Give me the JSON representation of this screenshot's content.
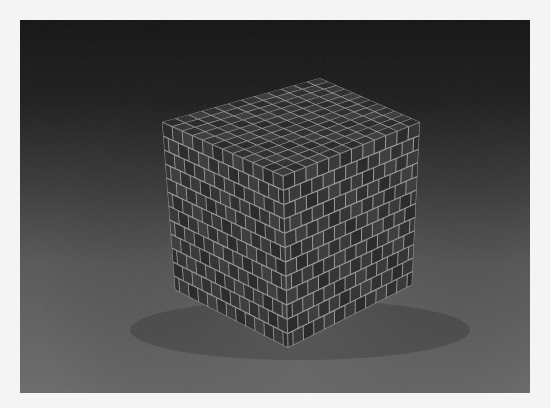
{
  "scene": {
    "description": "3D render of a cube textured with grey tiles/bricks on a grey floor with dark gradient background",
    "colors": {
      "background_top": "#121212",
      "background_bottom": "#6a6a6a",
      "tile_dark": "#2e2e2e",
      "tile_grout": "#9a9a9a",
      "margin": "#f4f4f4"
    },
    "cube": {
      "vertices": {
        "top_back": [
          320,
          78
        ],
        "top_left": [
          162,
          122
        ],
        "top_right": [
          420,
          122
        ],
        "top_front": [
          283,
          176
        ],
        "bottom_left": [
          175,
          290
        ],
        "bottom_front": [
          288,
          348
        ],
        "bottom_right": [
          412,
          285
        ]
      },
      "grid_divisions": 12
    }
  }
}
